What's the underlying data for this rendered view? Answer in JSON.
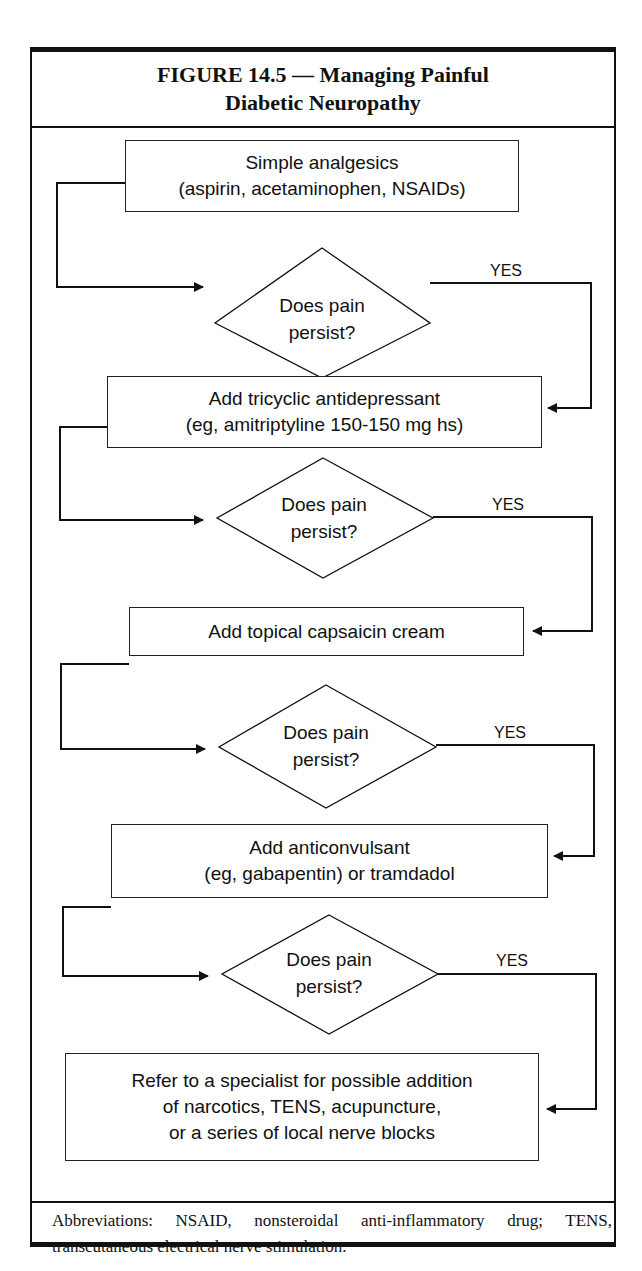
{
  "figure": {
    "title_line1": "FIGURE 14.5 — Managing Painful",
    "title_line2": "Diabetic Neuropathy"
  },
  "flow": {
    "steps": [
      {
        "line1": "Simple analgesics",
        "line2": "(aspirin, acetaminophen, NSAIDs)"
      },
      {
        "line1": "Add tricyclic antidepressant",
        "line2": "(eg, amitriptyline 150-150 mg hs)"
      },
      {
        "line1": "Add topical capsaicin cream"
      },
      {
        "line1": "Add anticonvulsant",
        "line2": "(eg, gabapentin) or tramdadol"
      },
      {
        "line1": "Refer to a specialist for possible addition",
        "line2": "of narcotics, TENS, acupuncture,",
        "line3": "or a series of local nerve blocks"
      }
    ],
    "decisions": [
      {
        "line1": "Does pain",
        "line2": "persist?",
        "branch": "YES"
      },
      {
        "line1": "Does pain",
        "line2": "persist?",
        "branch": "YES"
      },
      {
        "line1": "Does pain",
        "line2": "persist?",
        "branch": "YES"
      },
      {
        "line1": "Does pain",
        "line2": "persist?",
        "branch": "YES"
      }
    ]
  },
  "footer": {
    "abbreviations": "Abbreviations: NSAID, nonsteroidal anti-inflammatory drug; TENS, transcutaneous electrical nerve stimulation."
  }
}
